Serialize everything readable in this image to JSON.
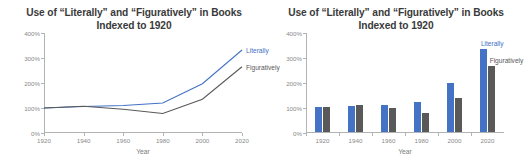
{
  "chart_data": [
    {
      "type": "line",
      "title": "Use of “Literally” and “Figuratively” in Books",
      "subtitle": "Indexed to 1920",
      "xlabel": "Year",
      "ylabel": "",
      "x": [
        1920,
        1940,
        1960,
        1980,
        2000,
        2020
      ],
      "xticklabels": [
        "1920",
        "1940",
        "1960",
        "1980",
        "2000",
        "2020"
      ],
      "yticklabels": [
        "0%",
        "100%",
        "200%",
        "300%",
        "400%"
      ],
      "yticks": [
        0,
        100,
        200,
        300,
        400
      ],
      "ylim": [
        0,
        400
      ],
      "xlim": [
        1920,
        2020
      ],
      "grid": false,
      "legend_position": "right-inline",
      "series": [
        {
          "name": "Literally",
          "color": "#4472C4",
          "values": [
            100,
            106,
            110,
            120,
            197,
            332
          ]
        },
        {
          "name": "Figuratively",
          "color": "#595959",
          "values": [
            100,
            107,
            95,
            78,
            135,
            265
          ]
        }
      ]
    },
    {
      "type": "bar",
      "title": "Use of “Literally” and “Figuratively” in Books",
      "subtitle": "Indexed to 1920",
      "xlabel": "Year",
      "ylabel": "",
      "categories": [
        "1920",
        "1940",
        "1960",
        "1980",
        "2000",
        "2020"
      ],
      "yticklabels": [
        "0%",
        "100%",
        "200%",
        "300%",
        "400%"
      ],
      "yticks": [
        0,
        100,
        200,
        300,
        400
      ],
      "ylim": [
        0,
        400
      ],
      "grid": false,
      "legend_position": "right-inline",
      "series": [
        {
          "name": "Literally",
          "color": "#4472C4",
          "values": [
            100,
            106,
            110,
            120,
            197,
            332
          ]
        },
        {
          "name": "Figuratively",
          "color": "#595959",
          "values": [
            100,
            107,
            95,
            78,
            135,
            265
          ]
        }
      ]
    }
  ],
  "line_chart": {
    "title_line1": "Use of “Literally” and “Figuratively” in Books",
    "title_line2": "Indexed to 1920",
    "xlabel": "Year",
    "legend": {
      "literally": "Literally",
      "figuratively": "Figuratively"
    }
  },
  "bar_chart": {
    "title_line1": "Use of “Literally” and “Figuratively” in Books",
    "title_line2": "Indexed to 1920",
    "xlabel": "Year",
    "legend": {
      "literally": "Literally",
      "figuratively": "Figuratively"
    }
  }
}
